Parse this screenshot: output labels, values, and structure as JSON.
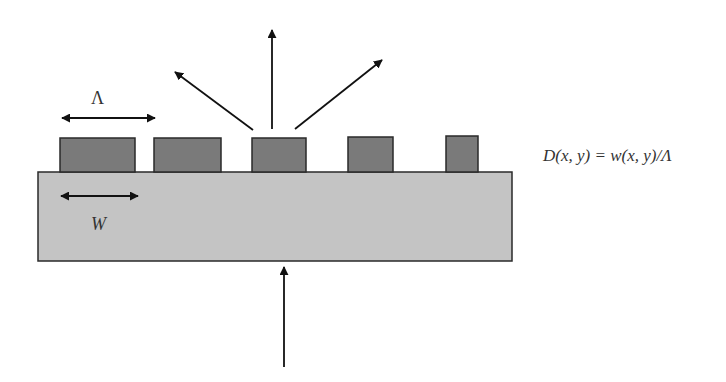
{
  "diagram": {
    "labels": {
      "period": "Λ",
      "width": "W",
      "equation": "D(x, y) = w(x, y)/Λ"
    },
    "colors": {
      "substrate": "#c4c4c4",
      "posts": "#7a7a7a",
      "outline": "#2a2a2a",
      "arrows": "#111111"
    },
    "substrate": {
      "x": 38,
      "y": 172,
      "width": 474,
      "height": 89
    },
    "posts": [
      {
        "x": 60,
        "y": 138,
        "width": 75,
        "height": 34
      },
      {
        "x": 154,
        "y": 138,
        "width": 67,
        "height": 34
      },
      {
        "x": 252,
        "y": 138,
        "width": 54,
        "height": 34
      },
      {
        "x": 348,
        "y": 137,
        "width": 45,
        "height": 35
      },
      {
        "x": 446,
        "y": 136,
        "width": 32,
        "height": 36
      }
    ],
    "arrows": [
      {
        "name": "period-arrow",
        "type": "double",
        "x1": 62,
        "y1": 118,
        "x2": 155,
        "y2": 118
      },
      {
        "name": "width-arrow",
        "type": "double",
        "x1": 61,
        "y1": 196,
        "x2": 138,
        "y2": 196
      },
      {
        "name": "diffracted-left",
        "type": "single",
        "x1": 253,
        "y1": 130,
        "x2": 175,
        "y2": 72
      },
      {
        "name": "diffracted-center",
        "type": "single",
        "x1": 272,
        "y1": 129,
        "x2": 272,
        "y2": 30
      },
      {
        "name": "diffracted-right",
        "type": "single",
        "x1": 295,
        "y1": 129,
        "x2": 382,
        "y2": 60
      },
      {
        "name": "incident",
        "type": "single",
        "x1": 284,
        "y1": 367,
        "x2": 284,
        "y2": 267
      }
    ]
  }
}
